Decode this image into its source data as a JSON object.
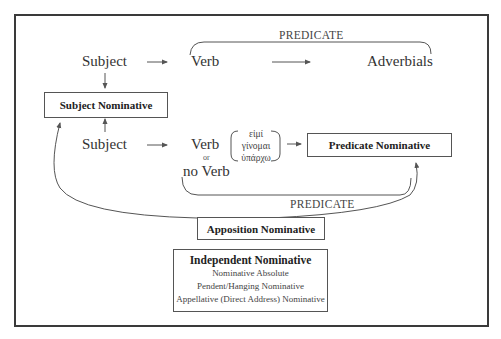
{
  "diagram": {
    "top_row": {
      "subject": "Subject",
      "verb": "Verb",
      "adverbials": "Adverbials",
      "predicate_label": "PREDICATE"
    },
    "subject_nominative": "Subject Nominative",
    "bottom_row": {
      "subject": "Subject",
      "verb": "Verb",
      "or": "or",
      "no_verb": "no Verb",
      "greek_verbs": [
        "εἰμί",
        "γίνομαι",
        "ὑπάρχω"
      ],
      "predicate_nominative": "Predicate Nominative",
      "predicate_label": "PREDICATE"
    },
    "apposition_nominative": "Apposition Nominative",
    "independent_nominative": {
      "title": "Independent Nominative",
      "items": [
        "Nominative Absolute",
        "Pendent/Hanging Nominative",
        "Appellative (Direct Address) Nominative"
      ]
    }
  },
  "colors": {
    "line": "#555555",
    "frame": "#3a3a3a",
    "text": "#333333"
  }
}
